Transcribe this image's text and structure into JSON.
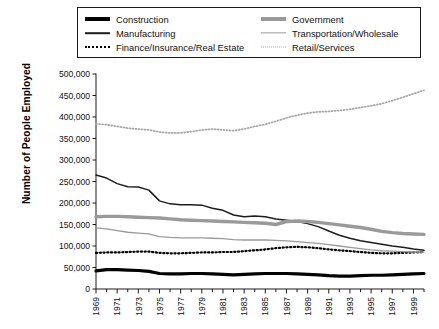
{
  "chart_data": {
    "type": "line",
    "title": "",
    "xlabel": "",
    "ylabel": "Number of People Employed",
    "xlim": [
      1969,
      2000
    ],
    "ylim": [
      0,
      500000
    ],
    "ytick_step": 50000,
    "grid": false,
    "legend_position": "top",
    "ytick_labels": [
      "0",
      "50,000",
      "100,000",
      "150,000",
      "200,000",
      "250,000",
      "300,000",
      "350,000",
      "400,000",
      "450,000",
      "500,000"
    ],
    "ytick_values": [
      0,
      50000,
      100000,
      150000,
      200000,
      250000,
      300000,
      350000,
      400000,
      450000,
      500000
    ],
    "xtick_labels": [
      "1969",
      "1971",
      "1973",
      "1975",
      "1977",
      "1979",
      "1981",
      "1983",
      "1985",
      "1987",
      "1989",
      "1991",
      "1993",
      "1995",
      "1997",
      "1999"
    ],
    "xtick_values": [
      1969,
      1971,
      1973,
      1975,
      1977,
      1979,
      1981,
      1983,
      1985,
      1987,
      1989,
      1991,
      1993,
      1995,
      1997,
      1999
    ],
    "x": [
      1969,
      1970,
      1971,
      1972,
      1973,
      1974,
      1975,
      1976,
      1977,
      1978,
      1979,
      1980,
      1981,
      1982,
      1983,
      1984,
      1985,
      1986,
      1987,
      1988,
      1989,
      1990,
      1991,
      1992,
      1993,
      1994,
      1995,
      1996,
      1997,
      1998,
      1999,
      2000
    ],
    "series": [
      {
        "name": "Construction",
        "style": "solid",
        "width": 3.2,
        "color": "#000000",
        "values": [
          42000,
          45000,
          45000,
          44000,
          43000,
          41000,
          36000,
          35000,
          35000,
          36000,
          36000,
          35000,
          34000,
          33000,
          34000,
          35000,
          36000,
          36000,
          36000,
          35000,
          34000,
          33000,
          31000,
          30000,
          30000,
          31000,
          32000,
          32000,
          33000,
          34000,
          35000,
          36000
        ]
      },
      {
        "name": "Manufacturing",
        "style": "solid",
        "width": 1.5,
        "color": "#1c1c1c",
        "values": [
          265000,
          258000,
          245000,
          238000,
          237000,
          230000,
          205000,
          198000,
          196000,
          196000,
          195000,
          188000,
          183000,
          172000,
          168000,
          170000,
          168000,
          163000,
          160000,
          157000,
          152000,
          145000,
          135000,
          125000,
          118000,
          112000,
          108000,
          104000,
          100000,
          97000,
          93000,
          90000
        ]
      },
      {
        "name": "Finance/Insurance/Real Estate",
        "style": "dotted",
        "width": 2.2,
        "color": "#000000",
        "values": [
          84000,
          85000,
          85000,
          86000,
          87000,
          87000,
          84000,
          83000,
          83000,
          84000,
          85000,
          85000,
          86000,
          86000,
          88000,
          90000,
          92000,
          95000,
          97000,
          98000,
          97000,
          95000,
          92000,
          90000,
          88000,
          86000,
          84000,
          83000,
          83000,
          84000,
          85000,
          86000
        ]
      },
      {
        "name": "Government",
        "style": "solid",
        "width": 3.4,
        "color": "#9a9a9a",
        "values": [
          168000,
          169000,
          169000,
          168000,
          167000,
          166000,
          165000,
          163000,
          161000,
          160000,
          159000,
          158000,
          157000,
          156000,
          155000,
          154000,
          153000,
          150000,
          157000,
          158000,
          157000,
          155000,
          152000,
          149000,
          146000,
          143000,
          139000,
          134000,
          131000,
          129000,
          128000,
          127000
        ]
      },
      {
        "name": "Transportation/Wholesale",
        "style": "solid",
        "width": 1.3,
        "color": "#9a9a9a",
        "values": [
          142000,
          140000,
          136000,
          132000,
          130000,
          128000,
          122000,
          120000,
          119000,
          119000,
          119000,
          118000,
          117000,
          115000,
          114000,
          114000,
          114000,
          113000,
          112000,
          110000,
          108000,
          106000,
          103000,
          100000,
          97000,
          94000,
          91000,
          89000,
          88000,
          87000,
          86000,
          86000
        ]
      },
      {
        "name": "Retail/Services",
        "style": "dotted",
        "width": 1.8,
        "color": "#a8a8a8",
        "values": [
          384000,
          382000,
          378000,
          374000,
          372000,
          370000,
          365000,
          363000,
          363000,
          366000,
          370000,
          372000,
          370000,
          368000,
          372000,
          378000,
          383000,
          390000,
          398000,
          404000,
          409000,
          412000,
          413000,
          415000,
          418000,
          422000,
          426000,
          431000,
          438000,
          446000,
          454000,
          462000
        ]
      }
    ]
  },
  "legend": {
    "left_column": [
      {
        "label": "Construction",
        "series": "Construction"
      },
      {
        "label": "Manufacturing",
        "series": "Manufacturing"
      },
      {
        "label": "Finance/Insurance/Real Estate",
        "series": "Finance/Insurance/Real Estate"
      }
    ],
    "right_column": [
      {
        "label": "Government",
        "series": "Government"
      },
      {
        "label": "Transportation/Wholesale",
        "series": "Transportation/Wholesale"
      },
      {
        "label": "Retail/Services",
        "series": "Retail/Services"
      }
    ]
  },
  "colors": {
    "construction": "#000000",
    "manufacturing": "#1c1c1c",
    "finance": "#000000",
    "government": "#9a9a9a",
    "transportation": "#9a9a9a",
    "retail": "#a8a8a8",
    "axis": "#1a1a1a",
    "background": "#ffffff"
  }
}
